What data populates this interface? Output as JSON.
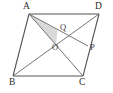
{
  "figure": {
    "kind": "geometry-diagram",
    "shape": "parallelogram",
    "background_color": "#ffffff",
    "stroke_color": "#555555",
    "shade_color": "#d9d9d9",
    "label_color": "#2b2b2b",
    "canvas": {
      "width": 113,
      "height": 93
    }
  },
  "labels": {
    "a": "A",
    "b": "B",
    "c": "C",
    "d": "D",
    "o": "O",
    "p": "P",
    "q": "Q"
  },
  "points": {
    "A": {
      "x": 29,
      "y": 14
    },
    "B": {
      "x": 13,
      "y": 76
    },
    "C": {
      "x": 83,
      "y": 76
    },
    "D": {
      "x": 99,
      "y": 14
    },
    "O": {
      "x": 56,
      "y": 45
    },
    "P": {
      "x": 88,
      "y": 46
    },
    "Q": {
      "x": 57.5,
      "y": 30
    }
  },
  "label_positions": {
    "A": {
      "left": 23,
      "top": 2
    },
    "B": {
      "left": 9,
      "top": 78
    },
    "C": {
      "left": 79,
      "top": 78
    },
    "D": {
      "left": 95,
      "top": 2
    },
    "O": {
      "left": 52,
      "top": 43
    },
    "P": {
      "left": 90,
      "top": 43
    },
    "Q": {
      "left": 60,
      "top": 23
    }
  },
  "segments": [
    {
      "name": "side-AD",
      "from": "A",
      "to": "D"
    },
    {
      "name": "side-AB",
      "from": "A",
      "to": "B"
    },
    {
      "name": "side-BC",
      "from": "B",
      "to": "C"
    },
    {
      "name": "side-DC",
      "from": "D",
      "to": "C"
    },
    {
      "name": "diagonal-AC",
      "from": "A",
      "to": "C"
    },
    {
      "name": "diagonal-BD",
      "from": "B",
      "to": "D"
    },
    {
      "name": "cevian-AP",
      "from": "A",
      "to": "P"
    }
  ],
  "shaded_region": {
    "name": "triangle-AQO",
    "vertices": [
      "A",
      "Q",
      "O"
    ]
  }
}
